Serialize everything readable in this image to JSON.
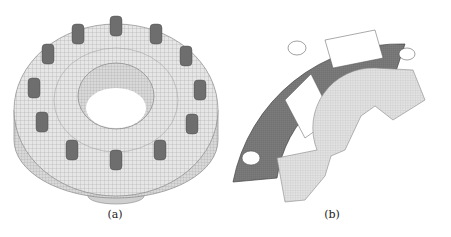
{
  "figure": {
    "panels": [
      {
        "id": "a",
        "caption": "(a)",
        "subject": "meshed bolted flange with 12 bolts"
      },
      {
        "id": "b",
        "caption": "(b)",
        "subject": "meshed quarter-section of flange with cutouts"
      }
    ],
    "colors": {
      "mesh_light": "#e4e4e4",
      "mesh_line": "#9a9a9a",
      "bolt": "#6e6e6e",
      "dark_part": "#7a7a7a",
      "background": "#ffffff"
    }
  }
}
